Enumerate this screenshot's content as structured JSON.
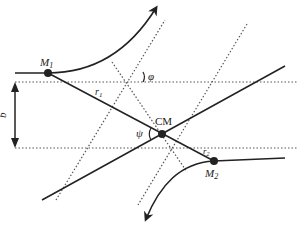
{
  "diagram": {
    "labels": {
      "m1": "M",
      "m1_sub": "1",
      "m2": "M",
      "m2_sub": "2",
      "r1": "r",
      "r1_sub": "1",
      "r2": "r",
      "r2_sub": "2",
      "cm": "CM",
      "phi": "φ",
      "psi": "ψ",
      "b": "b"
    },
    "colors": {
      "stroke": "#222222",
      "dotted": "#555555",
      "background": "#ffffff"
    },
    "elements": [
      "trajectory of M1 (incoming horizontal, curving up with arrow)",
      "trajectory of M2 (incoming horizontal, curving down with arrow)",
      "line M1–CM–M2 and asymptote line",
      "two horizontal dotted asymptotes separated by impact parameter b",
      "dotted asymptotes of outgoing trajectories",
      "angles phi and psi"
    ]
  }
}
